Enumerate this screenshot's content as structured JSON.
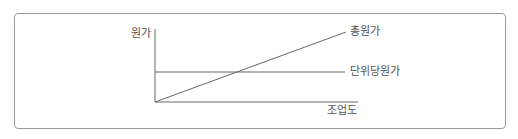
{
  "diagram": {
    "type": "cost-behavior-graph",
    "y_axis_label": "원가",
    "x_axis_label": "조업도",
    "lines": [
      {
        "label": "총원가",
        "shape": "increasing-linear-from-origin"
      },
      {
        "label": "단위당원가",
        "shape": "constant-horizontal"
      }
    ],
    "colors": {
      "line": "#555555",
      "frame": "#9a9a9a",
      "text": "#555555"
    }
  }
}
